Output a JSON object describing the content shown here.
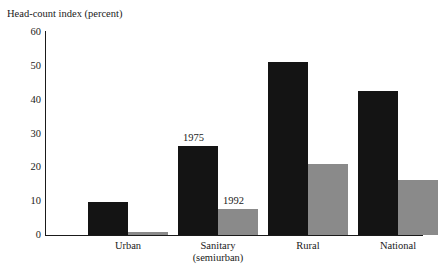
{
  "cropped_top_text": "",
  "chart_data": {
    "type": "bar",
    "title": "",
    "xlabel": "",
    "ylabel": "Head-count index (percent)",
    "ylim": [
      0,
      60
    ],
    "yticks": [
      0,
      10,
      20,
      30,
      40,
      50,
      60
    ],
    "ytick_labels": [
      "0",
      "10",
      "20",
      "30",
      "40",
      "50",
      "60"
    ],
    "grid": false,
    "legend_position": "data-labels-above-bars",
    "categories": [
      "Urban",
      "Sanitary (semiurban)",
      "Rural",
      "National"
    ],
    "category_lines": [
      [
        "Urban",
        ""
      ],
      [
        "Sanitary",
        "(semiurban)"
      ],
      [
        "Rural",
        ""
      ],
      [
        "National",
        ""
      ]
    ],
    "series": [
      {
        "name": "1975",
        "color": "#141414",
        "values": [
          9.8,
          26.3,
          51.2,
          42.5
        ]
      },
      {
        "name": "1992",
        "color": "#8a8a8a",
        "values": [
          1.0,
          7.8,
          21.0,
          16.2
        ]
      }
    ],
    "annotations": [
      {
        "text": "1975",
        "series": "1975",
        "category": "Sanitary (semiurban)"
      },
      {
        "text": "1992",
        "series": "1992",
        "category": "Sanitary (semiurban)"
      }
    ]
  },
  "colors": {
    "series_1975": "#141414",
    "series_1992": "#8a8a8a",
    "axis": "#1a1a1a",
    "background": "#ffffff"
  }
}
